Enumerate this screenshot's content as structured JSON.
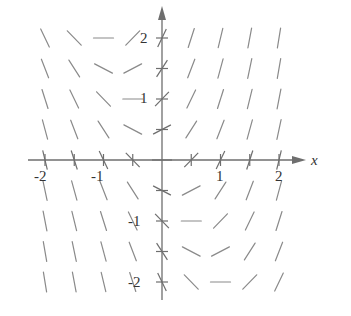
{
  "figure": {
    "type": "slope-field",
    "x_axis_label": "x",
    "y_axis_label": "y",
    "x_tick_labels": [
      {
        "value": -2,
        "text": "-2"
      },
      {
        "value": -1,
        "text": "-1"
      },
      {
        "value": 1,
        "text": "1"
      },
      {
        "value": 2,
        "text": "2"
      }
    ],
    "y_tick_labels": [
      {
        "value": 2,
        "text": "2"
      },
      {
        "value": 1,
        "text": "1"
      },
      {
        "value": -1,
        "text": "-1"
      },
      {
        "value": -2,
        "text": "-2"
      }
    ],
    "grid_values": [
      -2,
      -1.5,
      -1,
      -0.5,
      0,
      0.5,
      1,
      1.5,
      2
    ],
    "colors": {
      "segments": "#8a8a8a",
      "axes": "#6e6e6e",
      "text": "#333333"
    }
  }
}
